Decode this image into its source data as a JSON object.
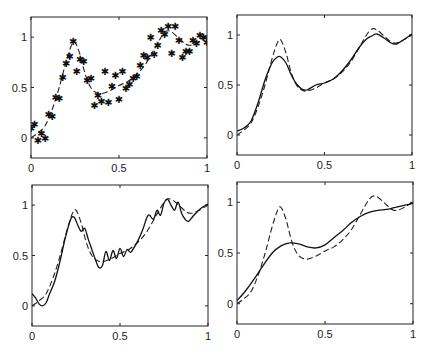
{
  "figure": {
    "layout": "2x2 subplots",
    "background": "#ffffff",
    "line_color": "#222222"
  },
  "chart_data": [
    {
      "type": "scatter",
      "panel": "top-left",
      "title": "",
      "xlabel": "",
      "ylabel": "",
      "xlim": [
        0,
        1
      ],
      "ylim": [
        -0.2,
        1.2
      ],
      "grid": false,
      "xticks": [
        0,
        0.5,
        1
      ],
      "xtick_labels": [
        "0",
        "0.5",
        "1"
      ],
      "yticks": [
        0,
        0.5,
        1
      ],
      "ytick_labels": [
        "0",
        "0.5",
        "1"
      ],
      "box_px": [
        31,
        17,
        207,
        158
      ],
      "series": [
        {
          "name": "true function",
          "style": "dashed",
          "x": [
            0,
            0.04,
            0.08,
            0.12,
            0.16,
            0.2,
            0.23,
            0.25,
            0.28,
            0.31,
            0.34,
            0.37,
            0.4,
            0.45,
            0.5,
            0.55,
            0.6,
            0.65,
            0.7,
            0.74,
            0.77,
            0.8,
            0.84,
            0.88,
            0.91,
            0.95,
            1.0
          ],
          "y": [
            0.0,
            0.05,
            0.12,
            0.28,
            0.5,
            0.76,
            0.92,
            0.95,
            0.82,
            0.62,
            0.5,
            0.45,
            0.44,
            0.47,
            0.52,
            0.56,
            0.63,
            0.73,
            0.88,
            1.0,
            1.06,
            1.05,
            0.99,
            0.93,
            0.92,
            0.95,
            1.0
          ]
        },
        {
          "name": "noisy samples",
          "style": "asterisk markers",
          "x": [
            0.0,
            0.02,
            0.04,
            0.06,
            0.08,
            0.1,
            0.12,
            0.14,
            0.16,
            0.18,
            0.2,
            0.22,
            0.24,
            0.26,
            0.28,
            0.3,
            0.32,
            0.34,
            0.36,
            0.38,
            0.4,
            0.42,
            0.44,
            0.46,
            0.48,
            0.5,
            0.52,
            0.54,
            0.56,
            0.58,
            0.6,
            0.62,
            0.64,
            0.66,
            0.68,
            0.7,
            0.72,
            0.74,
            0.76,
            0.78,
            0.8,
            0.82,
            0.84,
            0.86,
            0.88,
            0.9,
            0.92,
            0.94,
            0.96,
            0.98,
            1.0
          ],
          "y": [
            0.1,
            0.14,
            -0.02,
            0.05,
            0.0,
            0.24,
            0.22,
            0.41,
            0.4,
            0.6,
            0.74,
            0.81,
            0.96,
            0.66,
            0.78,
            0.76,
            0.57,
            0.59,
            0.33,
            0.43,
            0.37,
            0.66,
            0.36,
            0.51,
            0.62,
            0.39,
            0.66,
            0.5,
            0.53,
            0.59,
            0.61,
            0.72,
            0.82,
            0.8,
            1.0,
            0.83,
            0.92,
            1.07,
            1.03,
            1.11,
            0.84,
            1.11,
            0.97,
            0.8,
            0.86,
            0.86,
            0.97,
            0.94,
            1.02,
            1.0,
            0.95
          ]
        }
      ]
    },
    {
      "type": "line",
      "panel": "top-right",
      "title": "",
      "xlabel": "",
      "ylabel": "",
      "xlim": [
        0,
        1
      ],
      "ylim": [
        -0.2,
        1.2
      ],
      "grid": false,
      "xticks": [
        0,
        0.5,
        1
      ],
      "xtick_labels": [
        "0",
        "0.5",
        "1"
      ],
      "yticks": [
        0,
        0.5,
        1
      ],
      "ytick_labels": [
        "0",
        "0.5",
        "1"
      ],
      "box_px": [
        237,
        15,
        412,
        155
      ],
      "series": [
        {
          "name": "true function",
          "style": "dashed",
          "x": [
            0,
            0.04,
            0.08,
            0.12,
            0.16,
            0.2,
            0.23,
            0.25,
            0.28,
            0.31,
            0.34,
            0.37,
            0.4,
            0.45,
            0.5,
            0.55,
            0.6,
            0.65,
            0.7,
            0.74,
            0.77,
            0.8,
            0.84,
            0.88,
            0.91,
            0.95,
            1.0
          ],
          "y": [
            0.0,
            0.05,
            0.12,
            0.28,
            0.5,
            0.76,
            0.92,
            0.95,
            0.82,
            0.62,
            0.5,
            0.45,
            0.44,
            0.47,
            0.52,
            0.56,
            0.63,
            0.73,
            0.88,
            1.0,
            1.06,
            1.05,
            0.99,
            0.93,
            0.92,
            0.95,
            1.0
          ]
        },
        {
          "name": "estimate",
          "style": "solid",
          "x": [
            0,
            0.04,
            0.08,
            0.12,
            0.16,
            0.2,
            0.23,
            0.25,
            0.28,
            0.31,
            0.34,
            0.37,
            0.4,
            0.45,
            0.5,
            0.55,
            0.6,
            0.65,
            0.7,
            0.74,
            0.77,
            0.8,
            0.84,
            0.88,
            0.91,
            0.95,
            1.0
          ],
          "y": [
            0.04,
            0.07,
            0.14,
            0.32,
            0.55,
            0.72,
            0.78,
            0.78,
            0.72,
            0.6,
            0.51,
            0.46,
            0.45,
            0.5,
            0.52,
            0.56,
            0.64,
            0.75,
            0.88,
            0.96,
            0.99,
            1.01,
            0.97,
            0.92,
            0.91,
            0.95,
            1.01
          ]
        }
      ]
    },
    {
      "type": "line",
      "panel": "bottom-left",
      "title": "",
      "xlabel": "",
      "ylabel": "",
      "xlim": [
        0,
        1
      ],
      "ylim": [
        -0.2,
        1.2
      ],
      "grid": false,
      "xticks": [
        0,
        0.5,
        1
      ],
      "xtick_labels": [
        "0",
        "0.5",
        "1"
      ],
      "yticks": [
        0,
        0.5,
        1
      ],
      "ytick_labels": [
        "0",
        "0.5",
        "1"
      ],
      "box_px": [
        32,
        185,
        208,
        326
      ],
      "series": [
        {
          "name": "true function",
          "style": "dashed",
          "x": [
            0,
            0.04,
            0.08,
            0.12,
            0.16,
            0.2,
            0.23,
            0.25,
            0.28,
            0.31,
            0.34,
            0.37,
            0.4,
            0.45,
            0.5,
            0.55,
            0.6,
            0.65,
            0.7,
            0.74,
            0.77,
            0.8,
            0.84,
            0.88,
            0.91,
            0.95,
            1.0
          ],
          "y": [
            0.0,
            0.05,
            0.12,
            0.28,
            0.5,
            0.76,
            0.92,
            0.95,
            0.82,
            0.62,
            0.5,
            0.45,
            0.44,
            0.47,
            0.52,
            0.56,
            0.63,
            0.73,
            0.88,
            1.0,
            1.06,
            1.05,
            0.99,
            0.93,
            0.92,
            0.95,
            1.0
          ]
        },
        {
          "name": "estimate (oscillatory)",
          "style": "solid",
          "x": [
            0,
            0.02,
            0.04,
            0.06,
            0.08,
            0.1,
            0.13,
            0.16,
            0.19,
            0.22,
            0.24,
            0.26,
            0.28,
            0.3,
            0.32,
            0.34,
            0.36,
            0.38,
            0.4,
            0.42,
            0.44,
            0.46,
            0.48,
            0.5,
            0.52,
            0.54,
            0.56,
            0.58,
            0.6,
            0.63,
            0.66,
            0.69,
            0.71,
            0.73,
            0.75,
            0.77,
            0.79,
            0.81,
            0.83,
            0.85,
            0.87,
            0.89,
            0.92,
            0.96,
            1.0
          ],
          "y": [
            0.12,
            0.08,
            0.02,
            0.0,
            0.03,
            0.12,
            0.25,
            0.45,
            0.68,
            0.86,
            0.88,
            0.8,
            0.74,
            0.77,
            0.66,
            0.56,
            0.46,
            0.38,
            0.4,
            0.54,
            0.45,
            0.55,
            0.47,
            0.57,
            0.49,
            0.56,
            0.53,
            0.58,
            0.64,
            0.76,
            0.9,
            0.86,
            0.95,
            0.9,
            1.02,
            1.06,
            1.0,
            0.95,
            1.03,
            0.92,
            0.86,
            0.84,
            0.9,
            0.97,
            1.01
          ]
        }
      ]
    },
    {
      "type": "line",
      "panel": "bottom-right",
      "title": "",
      "xlabel": "",
      "ylabel": "",
      "xlim": [
        0,
        1
      ],
      "ylim": [
        -0.2,
        1.2
      ],
      "grid": false,
      "xticks": [
        0,
        0.5,
        1
      ],
      "xtick_labels": [
        "0",
        "0.5",
        "1"
      ],
      "yticks": [
        0,
        0.5,
        1
      ],
      "ytick_labels": [
        "0",
        "0.5",
        "1"
      ],
      "box_px": [
        237,
        182,
        413,
        324
      ],
      "series": [
        {
          "name": "true function",
          "style": "dashed",
          "x": [
            0,
            0.04,
            0.08,
            0.12,
            0.16,
            0.2,
            0.23,
            0.25,
            0.28,
            0.31,
            0.34,
            0.37,
            0.4,
            0.45,
            0.5,
            0.55,
            0.6,
            0.65,
            0.7,
            0.74,
            0.77,
            0.8,
            0.84,
            0.88,
            0.91,
            0.95,
            1.0
          ],
          "y": [
            0.0,
            0.05,
            0.12,
            0.28,
            0.5,
            0.76,
            0.92,
            0.95,
            0.82,
            0.62,
            0.5,
            0.45,
            0.44,
            0.47,
            0.52,
            0.56,
            0.63,
            0.73,
            0.88,
            1.0,
            1.06,
            1.05,
            0.99,
            0.93,
            0.92,
            0.95,
            1.0
          ]
        },
        {
          "name": "estimate (oversmoothed)",
          "style": "solid",
          "x": [
            0,
            0.05,
            0.1,
            0.15,
            0.2,
            0.25,
            0.3,
            0.35,
            0.4,
            0.45,
            0.5,
            0.55,
            0.6,
            0.65,
            0.7,
            0.75,
            0.8,
            0.85,
            0.9,
            0.95,
            1.0
          ],
          "y": [
            0.03,
            0.13,
            0.25,
            0.38,
            0.5,
            0.57,
            0.6,
            0.59,
            0.56,
            0.55,
            0.58,
            0.65,
            0.72,
            0.8,
            0.86,
            0.9,
            0.92,
            0.93,
            0.95,
            0.97,
            0.99
          ]
        }
      ]
    }
  ]
}
